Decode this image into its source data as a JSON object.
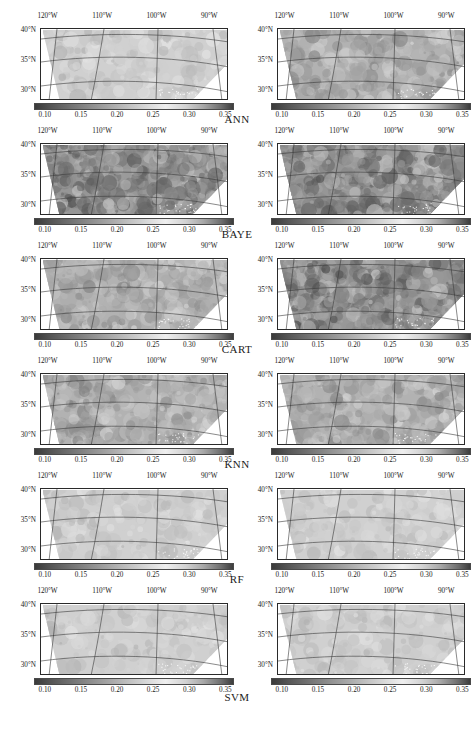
{
  "figure": {
    "type": "map-grid",
    "columns": 2,
    "rows": 6,
    "projection": "conic",
    "region": "Southwestern United States swath"
  },
  "axes": {
    "x_ticks": [
      "120°W",
      "110°W",
      "100°W",
      "90°W"
    ],
    "x_tick_positions": [
      0.04,
      0.33,
      0.62,
      0.9
    ],
    "y_ticks": [
      "40°N",
      "35°N",
      "30°N"
    ],
    "y_tick_positions": [
      0.03,
      0.44,
      0.86
    ]
  },
  "colorbar": {
    "ticks": [
      "0.10",
      "0.15",
      "0.20",
      "0.25",
      "0.30",
      "0.35"
    ],
    "tick_values": [
      0.1,
      0.15,
      0.2,
      0.25,
      0.3,
      0.35
    ],
    "vmin": 0.085,
    "vmax": 0.362,
    "orientation": "horizontal",
    "colormap": "grayscale",
    "colors": {
      "low": "#3a3a3a",
      "mid": "#efefef",
      "high": "#3d3d3d"
    }
  },
  "rows": [
    {
      "label": "ANN",
      "left": {
        "name": "ann-left-map",
        "tone": "light"
      },
      "right": {
        "name": "ann-right-map",
        "tone": "medium"
      }
    },
    {
      "label": "BAYE",
      "left": {
        "name": "baye-left-map",
        "tone": "dark"
      },
      "right": {
        "name": "baye-right-map",
        "tone": "dark"
      }
    },
    {
      "label": "CART",
      "left": {
        "name": "cart-left-map",
        "tone": "medium"
      },
      "right": {
        "name": "cart-right-map",
        "tone": "dark"
      }
    },
    {
      "label": "KNN",
      "left": {
        "name": "knn-left-map",
        "tone": "medium"
      },
      "right": {
        "name": "knn-right-map",
        "tone": "medium"
      }
    },
    {
      "label": "RF",
      "left": {
        "name": "rf-left-map",
        "tone": "light"
      },
      "right": {
        "name": "rf-right-map",
        "tone": "light"
      }
    },
    {
      "label": "SVM",
      "left": {
        "name": "svm-left-map",
        "tone": "light"
      },
      "right": {
        "name": "svm-right-map",
        "tone": "light"
      }
    }
  ],
  "chart_data": {
    "type": "heatmap",
    "title": "",
    "xlabel": "",
    "ylabel": "",
    "colorbar_label": "",
    "panel_row_labels": [
      "ANN",
      "BAYE",
      "CART",
      "KNN",
      "RF",
      "SVM"
    ],
    "panel_column_count": 2,
    "x_tick_labels": [
      "120°W",
      "110°W",
      "100°W",
      "90°W"
    ],
    "y_tick_labels": [
      "40°N",
      "35°N",
      "30°N"
    ],
    "colorbar_tick_labels": [
      "0.10",
      "0.15",
      "0.20",
      "0.25",
      "0.30",
      "0.35"
    ],
    "colorbar_range": [
      0.085,
      0.362
    ],
    "grid": true,
    "legend_position": "below-each-panel",
    "series": [
      {
        "name": "ANN left",
        "mean_value": 0.3,
        "value_range": [
          0.18,
          0.35
        ]
      },
      {
        "name": "ANN right",
        "mean_value": 0.26,
        "value_range": [
          0.13,
          0.34
        ]
      },
      {
        "name": "BAYE left",
        "mean_value": 0.22,
        "value_range": [
          0.1,
          0.34
        ]
      },
      {
        "name": "BAYE right",
        "mean_value": 0.21,
        "value_range": [
          0.1,
          0.34
        ]
      },
      {
        "name": "CART left",
        "mean_value": 0.27,
        "value_range": [
          0.15,
          0.34
        ]
      },
      {
        "name": "CART right",
        "mean_value": 0.22,
        "value_range": [
          0.11,
          0.34
        ]
      },
      {
        "name": "KNN left",
        "mean_value": 0.28,
        "value_range": [
          0.16,
          0.34
        ]
      },
      {
        "name": "KNN right",
        "mean_value": 0.25,
        "value_range": [
          0.14,
          0.34
        ]
      },
      {
        "name": "RF left",
        "mean_value": 0.31,
        "value_range": [
          0.2,
          0.35
        ]
      },
      {
        "name": "RF right",
        "mean_value": 0.3,
        "value_range": [
          0.19,
          0.35
        ]
      },
      {
        "name": "SVM left",
        "mean_value": 0.31,
        "value_range": [
          0.2,
          0.35
        ]
      },
      {
        "name": "SVM right",
        "mean_value": 0.31,
        "value_range": [
          0.2,
          0.35
        ]
      }
    ]
  }
}
